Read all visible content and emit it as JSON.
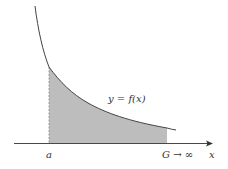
{
  "diagram": {
    "curve_label": "y = f(x)",
    "axis_label": "x",
    "lower_bound_label": "a",
    "upper_bound_label": "G → ∞",
    "colors": {
      "curve": "#444444",
      "axis": "#333333",
      "fill": "#bdbdbd",
      "dashed": "#888888",
      "text": "#333333"
    }
  }
}
